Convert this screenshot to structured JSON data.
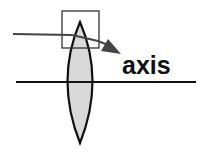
{
  "diagram": {
    "label": "axis",
    "colors": {
      "lens_fill": "#d9d9d9",
      "stroke": "#111111",
      "ray": "#444444",
      "box": "#333333"
    }
  }
}
